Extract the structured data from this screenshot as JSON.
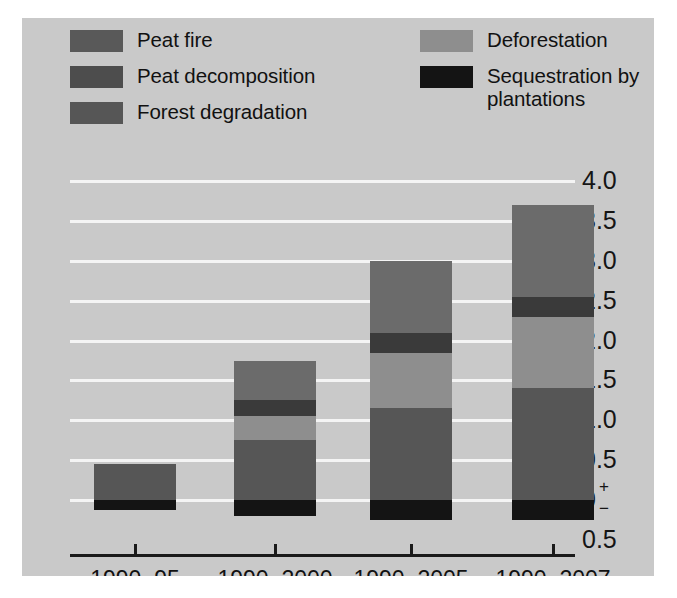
{
  "figure": {
    "panel_background": "#c9c9c9",
    "page_background": "#ffffff"
  },
  "legend": {
    "left_column": [
      {
        "label": "Peat fire",
        "color": "#595959",
        "icon": "legend-swatch-icon"
      },
      {
        "label": "Peat decomposition",
        "color": "#4d4d4d",
        "icon": "legend-swatch-icon"
      },
      {
        "label": "Forest degradation",
        "color": "#565656",
        "icon": "legend-swatch-icon"
      }
    ],
    "right_column": [
      {
        "label": "Deforestation",
        "color": "#8e8e8e",
        "icon": "legend-swatch-icon"
      },
      {
        "label": "Sequestration by\nplantations",
        "color": "#141414",
        "icon": "legend-swatch-icon"
      }
    ]
  },
  "axes": {
    "y_ticks": [
      "4.0",
      "3.5",
      "3.0",
      "2.5",
      "2.0",
      "1.5",
      "1.0",
      "0.5",
      "0",
      "0.5"
    ],
    "y_zero_superscript": "+",
    "y_zero_subscript": "−",
    "y_min": -0.5,
    "y_max": 4.0,
    "x_labels": [
      "1990–95",
      "1990–2000",
      "1990–2005",
      "1990–2007"
    ],
    "grid": true,
    "gridline_color": "#f4f4f4",
    "axis_color": "#1a1a1a"
  },
  "chart_data": {
    "type": "bar",
    "subtype": "stacked-bar-with-negative",
    "title": "",
    "xlabel": "",
    "ylabel": "",
    "ylim": [
      -0.5,
      4.0
    ],
    "categories": [
      "1990–95",
      "1990–2000",
      "1990–2005",
      "1990–2007"
    ],
    "series": [
      {
        "name": "Forest degradation",
        "color": "#565656",
        "values": [
          0.45,
          0.75,
          1.15,
          1.4
        ]
      },
      {
        "name": "Deforestation",
        "color": "#8e8e8e",
        "values": [
          0.0,
          0.3,
          0.7,
          0.9
        ]
      },
      {
        "name": "Peat decomposition",
        "color": "#3a3a3a",
        "values": [
          0.0,
          0.2,
          0.25,
          0.25
        ]
      },
      {
        "name": "Peat fire",
        "color": "#6b6b6b",
        "values": [
          0.0,
          0.5,
          0.9,
          1.15
        ]
      },
      {
        "name": "Sequestration by plantations",
        "color": "#141414",
        "values": [
          -0.12,
          -0.2,
          -0.25,
          -0.25
        ]
      }
    ],
    "totals_positive": [
      0.45,
      1.75,
      3.0,
      3.7
    ],
    "legend_position": "top",
    "units": "Gt CO2"
  }
}
